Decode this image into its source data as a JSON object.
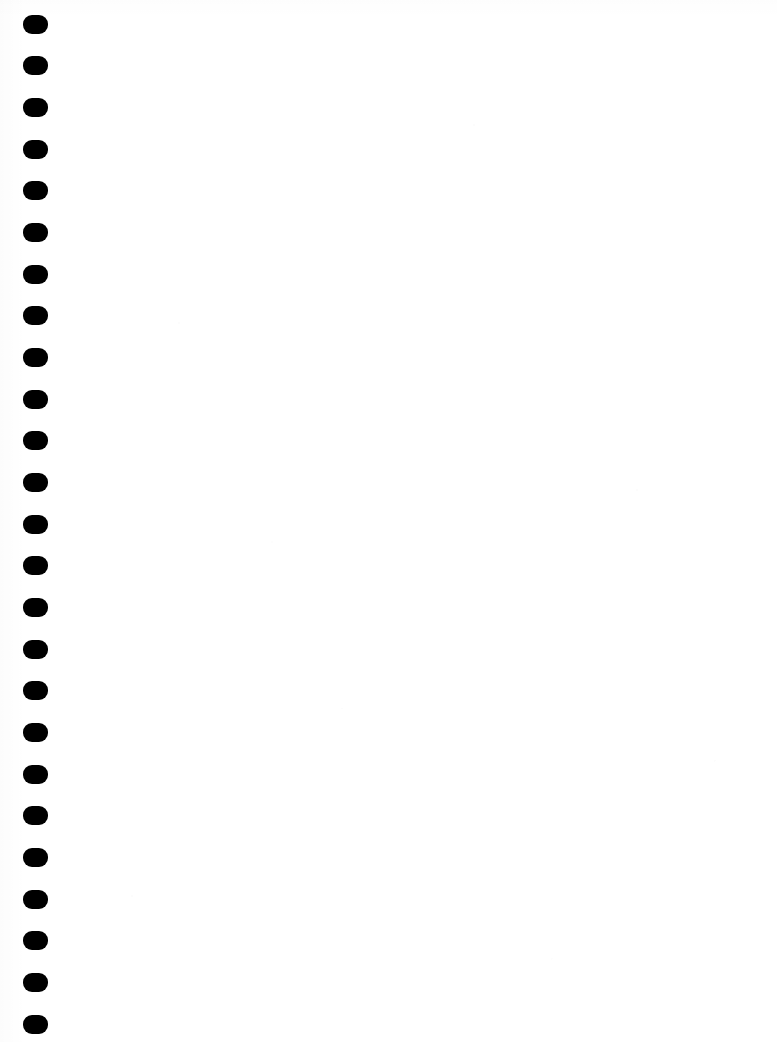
{
  "document": {
    "kind": "scanned-page",
    "page_label": "",
    "description": "Blank scanned notebook page with wire/spiral binding holes along the left edge",
    "content_text": "",
    "has_visible_text": false,
    "has_ruling_lines": false,
    "has_margin_line": false
  },
  "canvas": {
    "width": 777,
    "height": 1042,
    "background_color": "#ffffff",
    "ink_color": "#000000"
  },
  "binding": {
    "name": "spiral-binding-holes",
    "edge": "left",
    "hole_count": 25,
    "hole_shape": "rounded-rectangle",
    "hole_color": "#000000",
    "hole_width": 25,
    "hole_height": 19,
    "hole_corner_radius": 9,
    "column_left_x": 23,
    "first_hole_center_y": 24,
    "vertical_pitch": 41.7,
    "holes": [
      {
        "index": 1,
        "x": 23,
        "y": 15,
        "w": 25,
        "h": 19
      },
      {
        "index": 2,
        "x": 23,
        "y": 56,
        "w": 25,
        "h": 19
      },
      {
        "index": 3,
        "x": 23,
        "y": 98,
        "w": 25,
        "h": 19
      },
      {
        "index": 4,
        "x": 23,
        "y": 140,
        "w": 25,
        "h": 19
      },
      {
        "index": 5,
        "x": 23,
        "y": 181,
        "w": 25,
        "h": 19
      },
      {
        "index": 6,
        "x": 23,
        "y": 223,
        "w": 25,
        "h": 19
      },
      {
        "index": 7,
        "x": 23,
        "y": 265,
        "w": 25,
        "h": 19
      },
      {
        "index": 8,
        "x": 23,
        "y": 306,
        "w": 25,
        "h": 19
      },
      {
        "index": 9,
        "x": 23,
        "y": 348,
        "w": 25,
        "h": 19
      },
      {
        "index": 10,
        "x": 23,
        "y": 390,
        "w": 25,
        "h": 19
      },
      {
        "index": 11,
        "x": 23,
        "y": 431,
        "w": 25,
        "h": 19
      },
      {
        "index": 12,
        "x": 23,
        "y": 473,
        "w": 25,
        "h": 19
      },
      {
        "index": 13,
        "x": 23,
        "y": 515,
        "w": 25,
        "h": 19
      },
      {
        "index": 14,
        "x": 23,
        "y": 556,
        "w": 25,
        "h": 19
      },
      {
        "index": 15,
        "x": 23,
        "y": 598,
        "w": 25,
        "h": 19
      },
      {
        "index": 16,
        "x": 23,
        "y": 640,
        "w": 25,
        "h": 19
      },
      {
        "index": 17,
        "x": 23,
        "y": 681,
        "w": 25,
        "h": 19
      },
      {
        "index": 18,
        "x": 23,
        "y": 723,
        "w": 25,
        "h": 19
      },
      {
        "index": 19,
        "x": 23,
        "y": 765,
        "w": 25,
        "h": 19
      },
      {
        "index": 20,
        "x": 23,
        "y": 806,
        "w": 25,
        "h": 19
      },
      {
        "index": 21,
        "x": 23,
        "y": 848,
        "w": 25,
        "h": 19
      },
      {
        "index": 22,
        "x": 23,
        "y": 890,
        "w": 25,
        "h": 19
      },
      {
        "index": 23,
        "x": 23,
        "y": 931,
        "w": 25,
        "h": 19
      },
      {
        "index": 24,
        "x": 23,
        "y": 973,
        "w": 25,
        "h": 19
      },
      {
        "index": 25,
        "x": 23,
        "y": 1015,
        "w": 25,
        "h": 19
      }
    ]
  }
}
